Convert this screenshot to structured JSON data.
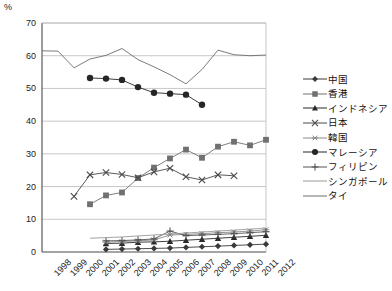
{
  "chart_data": {
    "type": "line",
    "title": "",
    "xlabel": "",
    "ylabel": "%",
    "ylim": [
      0,
      70
    ],
    "ytick_step": 10,
    "yticks": [
      0,
      10,
      20,
      30,
      40,
      50,
      60,
      70
    ],
    "grid": true,
    "legend_position": "right",
    "categories": [
      "1998",
      "1999",
      "2000",
      "2001",
      "2002",
      "2003",
      "2004",
      "2005",
      "2006",
      "2007",
      "2008",
      "2009",
      "2010",
      "2011",
      "2012"
    ],
    "series": [
      {
        "name": "中国",
        "marker": "diamond",
        "color": "#3a3a3a",
        "values": [
          null,
          null,
          null,
          null,
          0.8,
          0.9,
          1.0,
          1.1,
          1.2,
          1.4,
          1.6,
          1.8,
          2.0,
          2.2,
          2.4
        ]
      },
      {
        "name": "香港",
        "marker": "square",
        "color": "#707070",
        "values": [
          null,
          null,
          null,
          14.6,
          17.3,
          18.2,
          22.6,
          25.8,
          28.6,
          31.3,
          28.8,
          32.2,
          33.7,
          32.6,
          34.3
        ]
      },
      {
        "name": "インドネシア",
        "marker": "triangle",
        "color": "#2b2b2b",
        "values": [
          null,
          null,
          null,
          null,
          2.6,
          2.7,
          3.0,
          3.1,
          3.3,
          3.6,
          3.9,
          4.2,
          4.5,
          4.8,
          5.1
        ]
      },
      {
        "name": "日本",
        "marker": "cross",
        "color": "#4a4a4a",
        "values": [
          null,
          null,
          17.0,
          23.6,
          24.3,
          23.7,
          22.7,
          24.5,
          25.6,
          23.0,
          22.0,
          23.6,
          23.3,
          null,
          null
        ]
      },
      {
        "name": "韓国",
        "marker": "asterisk",
        "color": "#8a8a8a",
        "values": [
          null,
          null,
          null,
          null,
          3.0,
          3.2,
          3.4,
          3.7,
          5.2,
          5.4,
          5.6,
          5.9,
          6.1,
          6.4,
          6.8
        ]
      },
      {
        "name": "マレーシア",
        "marker": "circle",
        "color": "#262626",
        "values": [
          null,
          null,
          null,
          53.2,
          53.0,
          52.6,
          50.4,
          48.7,
          48.4,
          48.1,
          45.0,
          null,
          null,
          null,
          null
        ]
      },
      {
        "name": "フィリピン",
        "marker": "plus",
        "color": "#555555",
        "values": [
          null,
          null,
          null,
          null,
          3.4,
          3.5,
          3.7,
          4.0,
          6.4,
          5.0,
          5.2,
          5.4,
          5.6,
          5.9,
          6.2
        ]
      },
      {
        "name": "シンガポール",
        "marker": "none",
        "color": "#9a9a9a",
        "values": [
          null,
          null,
          null,
          4.2,
          4.4,
          4.6,
          4.9,
          5.2,
          5.5,
          5.8,
          6.1,
          6.4,
          6.7,
          7.0,
          7.3
        ]
      },
      {
        "name": "タイ",
        "marker": "none",
        "color": "#6d6d6d",
        "values": [
          61.5,
          61.4,
          56.3,
          59.0,
          60.1,
          62.2,
          58.8,
          56.6,
          54.2,
          51.4,
          55.8,
          61.7,
          60.3,
          60.0,
          60.2
        ]
      }
    ]
  },
  "legend": {
    "items": [
      {
        "label": "中国"
      },
      {
        "label": "香港"
      },
      {
        "label": "インドネシア"
      },
      {
        "label": "日本"
      },
      {
        "label": "韓国"
      },
      {
        "label": "マレーシア"
      },
      {
        "label": "フィリピン"
      },
      {
        "label": "シンガポール"
      },
      {
        "label": "タイ"
      }
    ]
  }
}
